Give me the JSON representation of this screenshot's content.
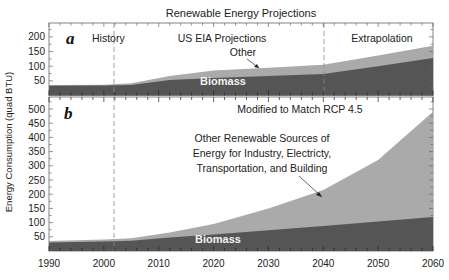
{
  "chart_data": [
    {
      "type": "area",
      "panel": "a",
      "title": "Renewable Energy Projections",
      "ylabel": "Energy Consumption (quad BTU)",
      "xlim": [
        1990,
        2060
      ],
      "ylim": [
        0,
        248
      ],
      "yticks": [
        50,
        100,
        150,
        200
      ],
      "x": [
        1990,
        2000,
        2005,
        2012,
        2020,
        2030,
        2040,
        2050,
        2060
      ],
      "series": [
        {
          "name": "Biomass",
          "values": [
            33,
            34,
            36,
            53,
            60,
            67,
            73,
            100,
            128
          ],
          "color": "#555555"
        },
        {
          "name": "Other",
          "values_total": [
            36,
            37,
            42,
            67,
            85,
            95,
            105,
            137,
            170
          ],
          "color": "#aaaaaa"
        }
      ],
      "regions": [
        {
          "label": "History",
          "x_range": [
            1990,
            2012
          ]
        },
        {
          "label": "US EIA Projections",
          "x_range": [
            2012,
            2040
          ]
        },
        {
          "label": "Extrapolation",
          "x_range": [
            2040,
            2060
          ]
        }
      ],
      "dividers": [
        2012,
        2040
      ],
      "annotations": [
        "a",
        "History",
        "US EIA Projections",
        "Extrapolation",
        "Other",
        "Biomass"
      ]
    },
    {
      "type": "area",
      "panel": "b",
      "title": "Modified to Match RCP 4.5",
      "ylabel": "Energy Consumption (quad BTU)",
      "xlim": [
        1990,
        2060
      ],
      "ylim": [
        0,
        540
      ],
      "yticks": [
        50,
        100,
        150,
        200,
        250,
        300,
        350,
        400,
        450,
        500
      ],
      "xticks": [
        1990,
        2000,
        2010,
        2020,
        2030,
        2040,
        2050,
        2060
      ],
      "x": [
        1990,
        2000,
        2005,
        2012,
        2020,
        2030,
        2040,
        2050,
        2060
      ],
      "series": [
        {
          "name": "Biomass",
          "values": [
            30,
            33,
            36,
            48,
            58,
            73,
            88,
            104,
            120
          ],
          "color": "#555555"
        },
        {
          "name": "Other Renewable Sources of Energy for Industry, Electricty, Transportation, and Building",
          "values_total": [
            35,
            40,
            45,
            65,
            95,
            150,
            215,
            320,
            490
          ],
          "color": "#aaaaaa"
        }
      ],
      "dividers": [
        2012
      ],
      "annotations": [
        "b",
        "Modified to Match RCP 4.5",
        "Other Renewable Sources of Energy for Industry, Electricty, Transportation, and Building",
        "Biomass"
      ]
    }
  ],
  "labels": {
    "title": "Renewable Energy Projections",
    "ylabel": "Energy Consumption (quad BTU)",
    "panel_a": {
      "letter": "a",
      "history": "History",
      "eia": "US EIA Projections",
      "extrap": "Extrapolation",
      "other": "Other",
      "biomass": "Biomass",
      "yticks": [
        "50",
        "100",
        "150",
        "200"
      ]
    },
    "panel_b": {
      "letter": "b",
      "subtitle": "Modified to Match RCP 4.5",
      "other_line1": "Other Renewable Sources of",
      "other_line2": "Energy for Industry, Electricty,",
      "other_line3": "Transportation, and Building",
      "biomass": "Biomass",
      "yticks": [
        "50",
        "100",
        "150",
        "200",
        "250",
        "300",
        "350",
        "400",
        "450",
        "500"
      ]
    },
    "xticks": [
      "1990",
      "2000",
      "2010",
      "2020",
      "2030",
      "2040",
      "2050",
      "2060"
    ]
  },
  "colors": {
    "biomass": "#555555",
    "other": "#aaaaaa",
    "frame": "#666666"
  }
}
